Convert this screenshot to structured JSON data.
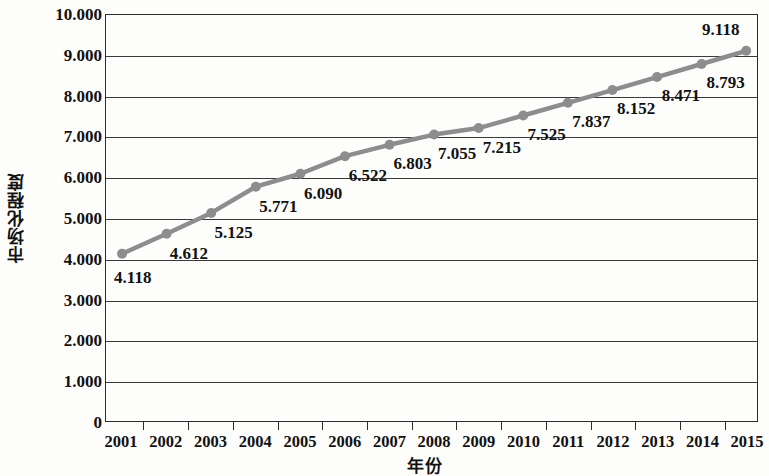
{
  "chart_data": {
    "type": "line",
    "title": "",
    "xlabel": "年份",
    "ylabel": "市场化程度",
    "categories": [
      "2001",
      "2002",
      "2003",
      "2004",
      "2005",
      "2006",
      "2007",
      "2008",
      "2009",
      "2010",
      "2011",
      "2012",
      "2013",
      "2014",
      "2015"
    ],
    "values": [
      4.118,
      4.612,
      5.125,
      5.771,
      6.09,
      6.522,
      6.803,
      7.055,
      7.215,
      7.525,
      7.837,
      8.152,
      8.471,
      8.793,
      9.118
    ],
    "point_labels": [
      "4.118",
      "4.612",
      "5.125",
      "5.771",
      "6.090",
      "6.522",
      "6.803",
      "7.055",
      "7.215",
      "7.525",
      "7.837",
      "8.152",
      "8.471",
      "8.793",
      "9.118"
    ],
    "ylim": [
      0,
      10
    ],
    "ytick_values": [
      0,
      1,
      2,
      3,
      4,
      5,
      6,
      7,
      8,
      9,
      10
    ],
    "ytick_labels": [
      "0",
      "1.000",
      "2.000",
      "3.000",
      "4.000",
      "5.000",
      "6.000",
      "7.000",
      "8.000",
      "9.000",
      "10.000"
    ],
    "grid": true,
    "legend": "none",
    "series_color": "#8d8d8d",
    "axis_color": "#2b2b2b",
    "marker": "circle"
  }
}
